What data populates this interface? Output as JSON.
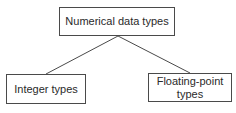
{
  "diagram": {
    "type": "tree",
    "root": {
      "label": "Numerical data types"
    },
    "children": [
      {
        "label": "Integer types"
      },
      {
        "label": "Floating-point\ntypes"
      }
    ],
    "colors": {
      "border": "#4a4a4a",
      "text": "#2a2a2a",
      "background": "#ffffff"
    }
  }
}
